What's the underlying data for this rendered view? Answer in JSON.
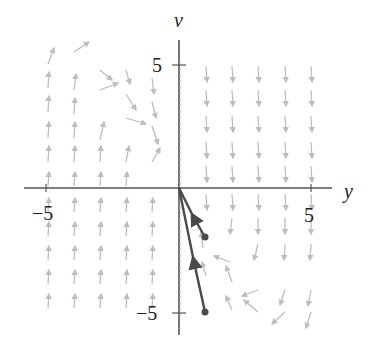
{
  "figure": {
    "axes": {
      "x_label": "y",
      "y_label": "v",
      "x_ticks": [
        {
          "value": "−5",
          "px": 46
        },
        {
          "value": "5",
          "px": 311
        }
      ],
      "y_ticks": [
        {
          "value": "5",
          "px": 65
        },
        {
          "value": "−5",
          "px": 313
        }
      ],
      "origin": [
        179,
        188
      ]
    },
    "colors": {
      "field": "#bdbdbd",
      "axis": "#555555",
      "trajectory": "#4a4a4a"
    },
    "field_arrows": [
      [
        48,
        64,
        54,
        48
      ],
      [
        74,
        52,
        89,
        42
      ],
      [
        48,
        88,
        49,
        72
      ],
      [
        74,
        90,
        76,
        74
      ],
      [
        100,
        70,
        112,
        80
      ],
      [
        126,
        70,
        130,
        84
      ],
      [
        48,
        112,
        49,
        96
      ],
      [
        74,
        114,
        75,
        98
      ],
      [
        100,
        90,
        118,
        83
      ],
      [
        126,
        94,
        136,
        110
      ],
      [
        152,
        78,
        154,
        94
      ],
      [
        48,
        138,
        49,
        122
      ],
      [
        74,
        138,
        75,
        122
      ],
      [
        100,
        140,
        104,
        122
      ],
      [
        126,
        118,
        146,
        124
      ],
      [
        152,
        102,
        156,
        118
      ],
      [
        48,
        162,
        49,
        146
      ],
      [
        74,
        162,
        75,
        146
      ],
      [
        100,
        162,
        101,
        146
      ],
      [
        126,
        162,
        129,
        146
      ],
      [
        152,
        126,
        158,
        144
      ],
      [
        48,
        186,
        49,
        172
      ],
      [
        74,
        186,
        75,
        172
      ],
      [
        100,
        186,
        101,
        172
      ],
      [
        126,
        186,
        127,
        172
      ],
      [
        152,
        162,
        160,
        148
      ],
      [
        48,
        212,
        49,
        198
      ],
      [
        74,
        212,
        75,
        198
      ],
      [
        100,
        212,
        101,
        198
      ],
      [
        126,
        212,
        127,
        198
      ],
      [
        152,
        212,
        153,
        198
      ],
      [
        48,
        236,
        49,
        222
      ],
      [
        74,
        236,
        75,
        222
      ],
      [
        100,
        236,
        101,
        222
      ],
      [
        126,
        236,
        127,
        222
      ],
      [
        152,
        236,
        153,
        222
      ],
      [
        48,
        260,
        49,
        246
      ],
      [
        74,
        260,
        75,
        246
      ],
      [
        100,
        260,
        101,
        246
      ],
      [
        126,
        260,
        127,
        246
      ],
      [
        152,
        260,
        153,
        246
      ],
      [
        48,
        284,
        49,
        270
      ],
      [
        74,
        284,
        75,
        270
      ],
      [
        100,
        284,
        101,
        270
      ],
      [
        126,
        284,
        127,
        270
      ],
      [
        152,
        284,
        153,
        270
      ],
      [
        48,
        308,
        49,
        294
      ],
      [
        74,
        308,
        75,
        294
      ],
      [
        100,
        308,
        101,
        294
      ],
      [
        126,
        308,
        127,
        294
      ],
      [
        152,
        308,
        153,
        294
      ],
      [
        206,
        66,
        207,
        82
      ],
      [
        232,
        66,
        233,
        82
      ],
      [
        258,
        66,
        259,
        82
      ],
      [
        285,
        66,
        286,
        82
      ],
      [
        311,
        66,
        312,
        82
      ],
      [
        206,
        90,
        207,
        106
      ],
      [
        232,
        90,
        233,
        106
      ],
      [
        258,
        90,
        259,
        106
      ],
      [
        285,
        90,
        286,
        106
      ],
      [
        311,
        90,
        312,
        106
      ],
      [
        206,
        116,
        207,
        132
      ],
      [
        232,
        116,
        233,
        132
      ],
      [
        258,
        116,
        259,
        132
      ],
      [
        285,
        116,
        286,
        132
      ],
      [
        311,
        116,
        312,
        132
      ],
      [
        206,
        142,
        207,
        158
      ],
      [
        232,
        142,
        233,
        158
      ],
      [
        258,
        142,
        259,
        158
      ],
      [
        285,
        142,
        286,
        158
      ],
      [
        311,
        142,
        312,
        158
      ],
      [
        206,
        166,
        207,
        182
      ],
      [
        232,
        166,
        233,
        182
      ],
      [
        258,
        166,
        259,
        182
      ],
      [
        285,
        166,
        286,
        182
      ],
      [
        311,
        166,
        312,
        182
      ],
      [
        206,
        194,
        207,
        210
      ],
      [
        232,
        194,
        233,
        210
      ],
      [
        258,
        194,
        259,
        210
      ],
      [
        285,
        194,
        286,
        210
      ],
      [
        311,
        194,
        312,
        210
      ],
      [
        232,
        218,
        230,
        234
      ],
      [
        258,
        218,
        258,
        234
      ],
      [
        285,
        218,
        285,
        234
      ],
      [
        311,
        218,
        311,
        234
      ],
      [
        203,
        248,
        201,
        232
      ],
      [
        230,
        262,
        214,
        256
      ],
      [
        258,
        244,
        254,
        260
      ],
      [
        285,
        244,
        284,
        260
      ],
      [
        311,
        244,
        310,
        260
      ],
      [
        206,
        276,
        202,
        262
      ],
      [
        232,
        282,
        226,
        266
      ],
      [
        258,
        290,
        242,
        296
      ],
      [
        285,
        290,
        280,
        305
      ],
      [
        311,
        290,
        308,
        306
      ],
      [
        232,
        310,
        226,
        296
      ],
      [
        258,
        312,
        244,
        300
      ],
      [
        285,
        312,
        272,
        324
      ],
      [
        311,
        312,
        306,
        328
      ]
    ],
    "trajectories": [
      {
        "from": [
          205,
          237
        ],
        "to": [
          179,
          188
        ],
        "arrow_at": [
          194,
          218
        ]
      },
      {
        "from": [
          205,
          312
        ],
        "to": [
          179,
          188
        ],
        "arrow_at": [
          194,
          262
        ]
      }
    ]
  }
}
